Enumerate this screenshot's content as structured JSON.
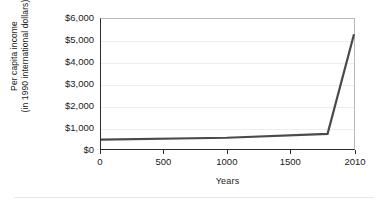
{
  "chart_data": {
    "type": "line",
    "title": "",
    "xlabel": "Years",
    "ylabel": "Per capita income (in 1990 international dollars)",
    "ylabel_lines": [
      "Per capita income",
      "(in 1990 international dollars)"
    ],
    "x": [
      0,
      1000,
      1800,
      2010
    ],
    "values": [
      430,
      520,
      700,
      5300
    ],
    "series": [
      {
        "name": "Per capita income",
        "points": [
          {
            "x": 0,
            "y": 430
          },
          {
            "x": 1000,
            "y": 520
          },
          {
            "x": 1800,
            "y": 700
          },
          {
            "x": 2010,
            "y": 5300
          }
        ]
      }
    ],
    "xlim": [
      0,
      2010
    ],
    "ylim": [
      0,
      6000
    ],
    "xticks": [
      0,
      500,
      1000,
      1500,
      2010
    ],
    "xtick_labels": [
      "0",
      "500",
      "1000",
      "1500",
      "2010"
    ],
    "yticks": [
      0,
      1000,
      2000,
      3000,
      4000,
      5000,
      6000
    ],
    "ytick_labels": [
      "$0",
      "$1,000",
      "$2,000",
      "$3,000",
      "$4,000",
      "$5,000",
      "$6,000"
    ],
    "grid": true,
    "grid_axis": "y",
    "legend": false,
    "legend_position": "none",
    "colors": {
      "series_line": "#4a4a4a",
      "axis": "#2b2b2b",
      "frame": "#b9b9b9",
      "gridline": "#ededed",
      "text": "#1a1a1a",
      "background": "#ffffff"
    }
  }
}
